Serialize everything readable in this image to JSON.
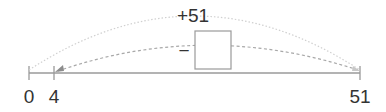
{
  "diagram": {
    "type": "number-line",
    "top_arc_label": "+51",
    "operator": "−",
    "answer_box": "",
    "ticks": [
      {
        "value": "0"
      },
      {
        "value": "4"
      },
      {
        "value": "51"
      }
    ],
    "colors": {
      "line": "#9a9a9a",
      "arc_top": "#d0d0d0",
      "arc_inner": "#a8a8a8",
      "text": "#333333",
      "box_border": "#9a9a9a"
    }
  }
}
